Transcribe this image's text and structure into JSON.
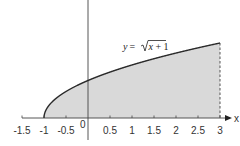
{
  "chart_data": {
    "type": "area",
    "title": "",
    "function_label": "y = √(x + 1)",
    "function_parts": {
      "lhs": "y",
      "eq": "=",
      "radicand": "x + 1"
    },
    "xlabel": "x",
    "ylabel": "",
    "origin_label": "0",
    "xlim": [
      -1.5,
      3
    ],
    "ylim": [
      0,
      2
    ],
    "x_ticks": [
      -1.5,
      -1,
      -0.5,
      0.5,
      1,
      1.5,
      2,
      2.5,
      3
    ],
    "x_tick_labels": [
      "-1.5",
      "-1",
      "-0.5",
      "0.5",
      "1",
      "1.5",
      "2",
      "2.5",
      "3"
    ],
    "grid": false,
    "legend": "none",
    "series": [
      {
        "name": "y = sqrt(x + 1)",
        "x": [
          -1,
          -0.75,
          -0.5,
          0,
          0.5,
          1,
          1.5,
          2,
          2.5,
          3
        ],
        "y": [
          0,
          0.5,
          0.707,
          1,
          1.225,
          1.414,
          1.581,
          1.732,
          1.871,
          2
        ]
      }
    ],
    "shaded_region": {
      "x_from": -1,
      "x_to": 3,
      "under": "y = sqrt(x + 1)"
    },
    "annotations": [
      {
        "type": "dashed-vertical-line",
        "x": 3,
        "y_from": 0,
        "y_to": 2
      }
    ]
  },
  "colors": {
    "curve": "#2a2a2a",
    "fill": "#d9d9d9",
    "axis": "#444444",
    "text": "#333333"
  }
}
